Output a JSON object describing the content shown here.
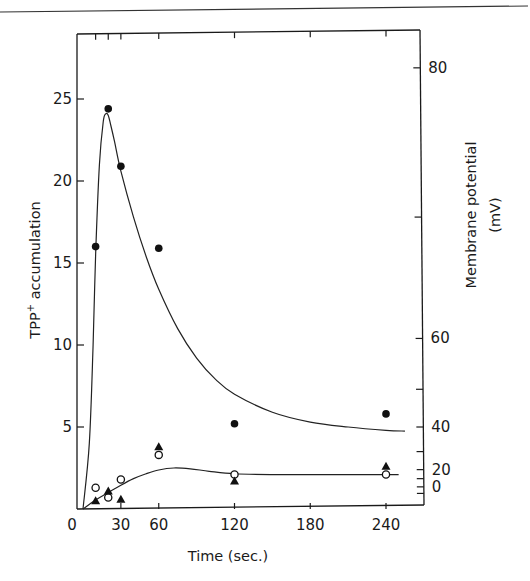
{
  "chart_data": {
    "type": "scatter",
    "title": "",
    "xlabel": "Time (sec.)",
    "ylabel": "TPP+ accumulation",
    "ylabel_main": "TPP",
    "ylabel_sup": "+",
    "ylabel_rest": " accumulation",
    "y2label_line1": "Membrane potential",
    "y2label_line2": "(mV)",
    "xlim": [
      0,
      270
    ],
    "ylim": [
      0,
      29
    ],
    "x_ticks": [
      0,
      30,
      60,
      120,
      180,
      240
    ],
    "x_tick_labels": [
      "0",
      "30",
      "60",
      "120",
      "180",
      "240"
    ],
    "x_minor_ticks": [
      10,
      20
    ],
    "y_ticks": [
      5,
      10,
      15,
      20,
      25
    ],
    "y_tick_labels": [
      "5",
      "10",
      "15",
      "20",
      "25"
    ],
    "y2_ticks_labeled": [
      {
        "label": "80",
        "pos": 26.9
      },
      {
        "label": "60",
        "pos": 10.4
      },
      {
        "label": "40",
        "pos": 5.0
      },
      {
        "label": "20",
        "pos": 2.4
      },
      {
        "label": "0",
        "pos": 1.35
      }
    ],
    "y2_ticks_minor_pos": [
      17.8,
      7.3,
      3.5,
      1.85,
      0.95
    ],
    "grid": false,
    "legend": null,
    "series": [
      {
        "name": "filled circles",
        "marker": "filled-circle",
        "x": [
          10,
          20,
          30,
          60,
          120,
          240
        ],
        "y": [
          16.0,
          24.4,
          20.9,
          15.9,
          5.2,
          5.8
        ]
      },
      {
        "name": "open circles",
        "marker": "open-circle",
        "x": [
          10,
          20,
          30,
          60,
          120,
          240
        ],
        "y": [
          1.3,
          0.7,
          1.8,
          3.3,
          2.1,
          2.1
        ]
      },
      {
        "name": "filled triangles",
        "marker": "filled-triangle",
        "x": [
          10,
          20,
          30,
          60,
          120,
          240
        ],
        "y": [
          0.5,
          1.1,
          0.6,
          3.8,
          1.7,
          2.6
        ]
      }
    ],
    "curves": [
      {
        "name": "upper fitted curve",
        "x": [
          0,
          5,
          8,
          10,
          13,
          16,
          18,
          20,
          22,
          25,
          30,
          40,
          50,
          60,
          75,
          90,
          105,
          120,
          150,
          180,
          210,
          240,
          255
        ],
        "y": [
          0,
          4,
          10,
          15.5,
          21,
          23.6,
          24.1,
          24.0,
          23.4,
          22.4,
          20.6,
          17.8,
          15.4,
          13.4,
          11.0,
          9.2,
          7.9,
          7.0,
          5.9,
          5.3,
          5.0,
          4.8,
          4.75
        ]
      },
      {
        "name": "lower fitted curve",
        "x": [
          0,
          10,
          20,
          30,
          40,
          50,
          60,
          72,
          85,
          100,
          120,
          150,
          180,
          210,
          240,
          250
        ],
        "y": [
          0,
          0.55,
          1.0,
          1.45,
          1.85,
          2.15,
          2.38,
          2.5,
          2.45,
          2.3,
          2.15,
          2.1,
          2.1,
          2.1,
          2.1,
          2.1
        ]
      }
    ]
  }
}
